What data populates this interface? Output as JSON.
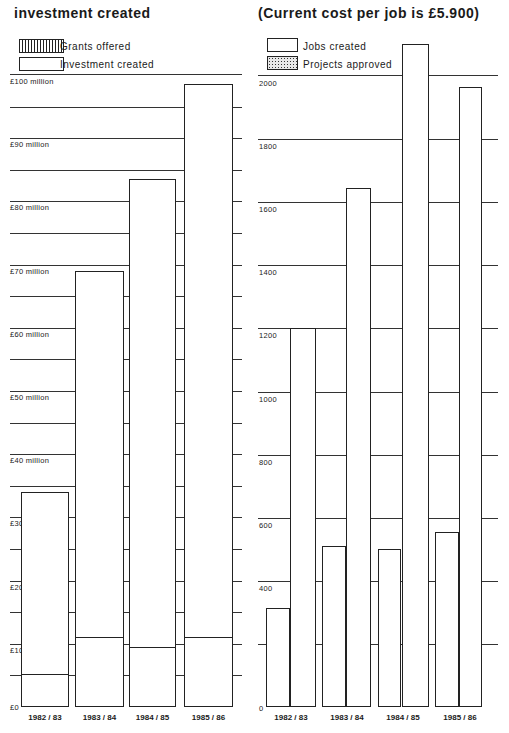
{
  "left_title": "investment  created",
  "right_title": "(Current  cost  per  job  is  £5.900)",
  "left_legend": [
    {
      "label": "Grants  offered",
      "pattern": "hatch"
    },
    {
      "label": "Investment  created",
      "pattern": "plain"
    }
  ],
  "right_legend": [
    {
      "label": "Jobs  created",
      "pattern": "plain"
    },
    {
      "label": "Projects  approved",
      "pattern": "dots"
    }
  ],
  "left_ticks": [
    "£100 million",
    "£90  million",
    "£80  million",
    "£70  million",
    "£60  million",
    "£50  million",
    "£40  million",
    "£30",
    "£20",
    "£10",
    "£0"
  ],
  "right_ticks": [
    "2000",
    "1800",
    "1600",
    "1400",
    "1200",
    "1000",
    "800",
    "600",
    "400",
    "0"
  ],
  "x_labels": [
    "1982/83",
    "1983/84",
    "1984/85",
    "1985/86"
  ],
  "chart_data": [
    {
      "type": "bar",
      "title": "investment created",
      "categories": [
        "1982/83",
        "1983/84",
        "1984/85",
        "1985/86"
      ],
      "series": [
        {
          "name": "Investment created",
          "values": [
            34,
            69,
            83.5,
            98.5
          ]
        },
        {
          "name": "Grants offered",
          "values": [
            5.2,
            11,
            9.5,
            11
          ]
        }
      ],
      "xlabel": "",
      "ylabel": "£ million",
      "ylim": [
        0,
        100
      ],
      "yticks": [
        0,
        10,
        20,
        30,
        40,
        50,
        60,
        70,
        80,
        90,
        100
      ],
      "grid": true,
      "legend_position": "top-left"
    },
    {
      "type": "bar",
      "title": "(Current cost per job is £5.900)",
      "categories": [
        "1982/83",
        "1983/84",
        "1984/85",
        "1985/86"
      ],
      "series": [
        {
          "name": "Projects approved",
          "values": [
            315,
            510,
            500,
            555
          ]
        },
        {
          "name": "Jobs created",
          "values": [
            1200,
            1645,
            2100,
            1965
          ]
        }
      ],
      "xlabel": "",
      "ylabel": "",
      "ylim": [
        0,
        2000
      ],
      "yticks": [
        0,
        400,
        600,
        800,
        1000,
        1200,
        1400,
        1600,
        1800,
        2000
      ],
      "grid": true,
      "legend_position": "top-left"
    }
  ]
}
